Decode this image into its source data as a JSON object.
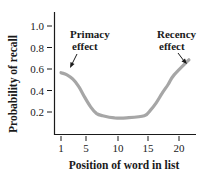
{
  "chart_data": {
    "type": "line",
    "title": "",
    "xlabel": "Position of word in list",
    "ylabel": "Probability of recall",
    "xticks": [
      1,
      5,
      10,
      15,
      20
    ],
    "yticks": [
      "0.2",
      "0.4",
      "0.6",
      "0.8",
      "1.0"
    ],
    "xlim": [
      1,
      22.5
    ],
    "ylim": [
      0,
      1.05
    ],
    "grid": false,
    "legend": null,
    "series": [
      {
        "name": "Serial position curve",
        "color": "#a6a6a6",
        "x": [
          1,
          2,
          3,
          4,
          5,
          6,
          7,
          8,
          10,
          12,
          15,
          16,
          17,
          18,
          19,
          20,
          22.5
        ],
        "y": [
          0.57,
          0.55,
          0.51,
          0.44,
          0.34,
          0.25,
          0.19,
          0.17,
          0.15,
          0.15,
          0.17,
          0.22,
          0.29,
          0.38,
          0.46,
          0.55,
          0.69
        ]
      }
    ],
    "annotations": [
      {
        "line1": "Primacy",
        "line2": "effect",
        "points_to_x": 1.5
      },
      {
        "line1": "Recency",
        "line2": "effect",
        "points_to_x": 21.5
      }
    ]
  },
  "labels": {
    "y_axis": "Probability of recall",
    "x_axis": "Position of word in list",
    "primacy_1": "Primacy",
    "primacy_2": "effect",
    "recency_1": "Recency",
    "recency_2": "effect",
    "xt1": "1",
    "xt5": "5",
    "xt10": "10",
    "xt15": "15",
    "xt20": "20",
    "yt02": "0.2",
    "yt04": "0.4",
    "yt06": "0.6",
    "yt08": "0.8",
    "yt10": "1.0"
  }
}
